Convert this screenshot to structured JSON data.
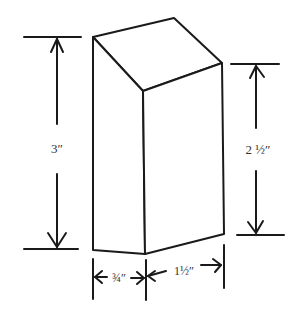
{
  "diagram": {
    "type": "isometric-block-dimension-drawing",
    "line_color": "#1a1a1a",
    "background": "#ffffff",
    "dimensions": {
      "back_height": "3″",
      "front_height": "2 ½″",
      "depth": "¾″",
      "width": "1½″"
    }
  }
}
